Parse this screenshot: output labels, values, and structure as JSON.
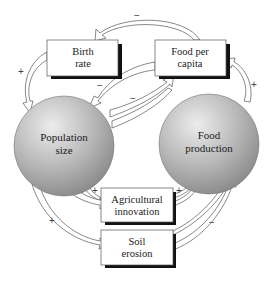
{
  "diagram": {
    "title": "",
    "nodes": {
      "population": {
        "line1": "Population",
        "line2": "size",
        "shape": "sphere"
      },
      "food_production": {
        "line1": "Food",
        "line2": "production",
        "shape": "sphere"
      },
      "birth_rate": {
        "line1": "Birth",
        "line2": "rate",
        "shape": "box"
      },
      "food_per_capita": {
        "line1": "Food per",
        "line2": "capita",
        "shape": "box"
      },
      "agri_innovation": {
        "line1": "Agricultural",
        "line2": "innovation",
        "shape": "box"
      },
      "soil_erosion": {
        "line1": "Soil",
        "line2": "erosion",
        "shape": "box"
      }
    },
    "edges": [
      {
        "from": "Birth rate",
        "to": "Population size",
        "sign": "+"
      },
      {
        "from": "Food per capita",
        "to": "Birth rate",
        "sign": "−"
      },
      {
        "from": "Food per capita",
        "to": "Population size",
        "sign": "−"
      },
      {
        "from": "Population size",
        "to": "Food per capita",
        "sign": "−"
      },
      {
        "from": "Food production",
        "to": "Food per capita",
        "sign": "+"
      },
      {
        "from": "Population size",
        "to": "Agricultural innovation",
        "sign": "+"
      },
      {
        "from": "Population size",
        "to": "Soil erosion",
        "sign": "+"
      },
      {
        "from": "Agricultural innovation",
        "to": "Food production",
        "sign": "+"
      },
      {
        "from": "Soil erosion",
        "to": "Food production",
        "sign": "−"
      }
    ],
    "signs": {
      "top_minus": "−",
      "left_plus": "+",
      "right_plus": "+",
      "mid_minus_1": "−",
      "mid_minus_2": "−",
      "agri_plus_left": "+",
      "agri_plus_right": "+",
      "soil_plus": "+",
      "soil_minus": "−"
    },
    "colors": {
      "sphere_light": "#e9e9e9",
      "sphere_dark": "#8c8c8c",
      "box_shadow": "#111111",
      "box_border": "#555555"
    }
  }
}
